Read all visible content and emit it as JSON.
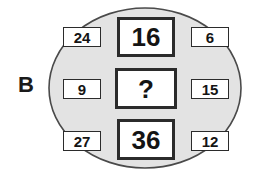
{
  "figure": {
    "panel_label": "B",
    "shape": "ellipse",
    "ellipse_fill": "#e3e3e3",
    "ellipse_stroke": "#4a4a4a",
    "box_fill": "#ffffff",
    "box_stroke": "#2b2b2b",
    "text_color": "#141414"
  },
  "cells": {
    "left": [
      {
        "name": "left-top",
        "value": "24"
      },
      {
        "name": "left-middle",
        "value": "9"
      },
      {
        "name": "left-bottom",
        "value": "27"
      }
    ],
    "center": [
      {
        "name": "center-top",
        "value": "16"
      },
      {
        "name": "center-middle",
        "value": "?"
      },
      {
        "name": "center-bottom",
        "value": "36"
      }
    ],
    "right": [
      {
        "name": "right-top",
        "value": "6"
      },
      {
        "name": "right-middle",
        "value": "15"
      },
      {
        "name": "right-bottom",
        "value": "12"
      }
    ]
  }
}
